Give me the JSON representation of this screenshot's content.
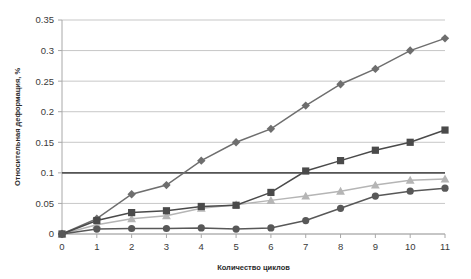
{
  "chart_data": {
    "type": "line",
    "title": "",
    "xlabel": "Количество циклов",
    "ylabel": "Относительная деформация, %",
    "x": [
      0,
      1,
      2,
      3,
      4,
      5,
      6,
      7,
      8,
      9,
      10,
      11
    ],
    "xlim": [
      0,
      11
    ],
    "ylim": [
      0,
      0.35
    ],
    "ytick_labels": [
      "0",
      "0.05",
      "0.1",
      "0.15",
      "0.2",
      "0.25",
      "0.3",
      "0.35"
    ],
    "ytick_values": [
      0,
      0.05,
      0.1,
      0.15,
      0.2,
      0.25,
      0.3,
      0.35
    ],
    "xtick_labels": [
      "0",
      "1",
      "2",
      "3",
      "4",
      "5",
      "6",
      "7",
      "8",
      "9",
      "10",
      "11"
    ],
    "grid": true,
    "legend": "none",
    "annotations": [
      {
        "name": "reference-line",
        "kind": "horizontal-line",
        "value": 0.1,
        "color": "#555555"
      }
    ],
    "series": [
      {
        "name": "series-diamond",
        "marker": "diamond",
        "color": "#6e6e6e",
        "values": [
          0,
          0.025,
          0.065,
          0.08,
          0.12,
          0.15,
          0.172,
          0.21,
          0.245,
          0.27,
          0.3,
          0.32
        ]
      },
      {
        "name": "series-square",
        "marker": "square",
        "color": "#4a4a4a",
        "values": [
          0,
          0.022,
          0.035,
          0.038,
          0.045,
          0.047,
          0.068,
          0.103,
          0.12,
          0.137,
          0.15,
          0.17
        ]
      },
      {
        "name": "series-triangle",
        "marker": "triangle",
        "color": "#b5b5b5",
        "values": [
          0,
          0.015,
          0.025,
          0.03,
          0.042,
          0.048,
          0.055,
          0.062,
          0.07,
          0.08,
          0.088,
          0.09
        ]
      },
      {
        "name": "series-circle",
        "marker": "circle",
        "color": "#585858",
        "values": [
          0,
          0.008,
          0.009,
          0.009,
          0.01,
          0.008,
          0.01,
          0.022,
          0.042,
          0.062,
          0.07,
          0.075
        ]
      }
    ]
  },
  "axes": {
    "y_title": "Относительная деформация, %",
    "x_title": "Количество циклов"
  }
}
